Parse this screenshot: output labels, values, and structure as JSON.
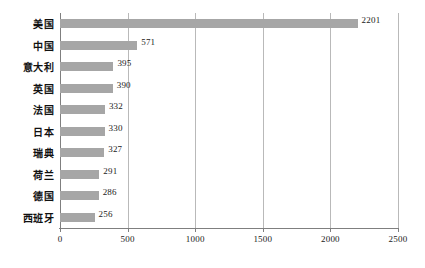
{
  "chart_data": {
    "type": "bar",
    "orientation": "horizontal",
    "title": "",
    "xlabel": "",
    "ylabel": "",
    "categories": [
      "美国",
      "中国",
      "意大利",
      "英国",
      "法国",
      "日本",
      "瑞典",
      "荷兰",
      "德国",
      "西班牙"
    ],
    "values": [
      2201,
      571,
      395,
      390,
      332,
      330,
      327,
      291,
      286,
      256
    ],
    "value_labels": [
      "2201",
      "571",
      "395",
      "390",
      "332",
      "330",
      "327",
      "291",
      "286",
      "256"
    ],
    "xlim": [
      0,
      2500
    ],
    "xticks": [
      0,
      500,
      1000,
      1500,
      2000,
      2500
    ],
    "xtick_labels": [
      "0",
      "500",
      "1000",
      "1500",
      "2000",
      "2500"
    ],
    "grid": "vertical",
    "legend": "none",
    "bar_color": "#a6a6a6",
    "axis_color": "#7f7f7f",
    "gridline_color": "#b9b9b9",
    "text_color": "#1a1a1a"
  }
}
